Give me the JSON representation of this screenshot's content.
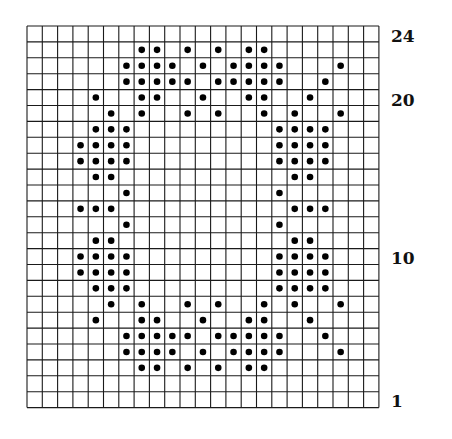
{
  "chart_data": {
    "type": "dot-grid-pattern",
    "title": "",
    "columns": 23,
    "rows": 24,
    "row_numbering": "bottom-to-top",
    "row_labels": [
      {
        "row": 24,
        "label": "24"
      },
      {
        "row": 20,
        "label": "20"
      },
      {
        "row": 10,
        "label": "10"
      },
      {
        "row": 1,
        "label": "1"
      }
    ],
    "dots_by_row": {
      "24": [],
      "23": [
        8,
        9,
        11,
        13,
        15,
        16
      ],
      "22": [
        7,
        8,
        9,
        10,
        12,
        14,
        15,
        16,
        17,
        21
      ],
      "21": [
        7,
        8,
        9,
        10,
        11,
        13,
        14,
        15,
        16,
        17,
        20
      ],
      "20": [
        5,
        8,
        9,
        12,
        15,
        16,
        19
      ],
      "19": [
        6,
        8,
        11,
        13,
        16,
        18,
        21
      ],
      "18": [
        5,
        6,
        7,
        17,
        18,
        19,
        20
      ],
      "17": [
        4,
        5,
        6,
        7,
        17,
        18,
        19,
        20
      ],
      "16": [
        4,
        5,
        6,
        7,
        17,
        18,
        19,
        20
      ],
      "15": [
        5,
        6,
        18,
        19
      ],
      "14": [
        7,
        17
      ],
      "13": [
        4,
        5,
        6,
        18,
        19,
        20
      ],
      "12": [
        7,
        17
      ],
      "11": [
        5,
        6,
        18,
        19
      ],
      "10": [
        4,
        5,
        6,
        7,
        17,
        18,
        19,
        20
      ],
      "9": [
        4,
        5,
        6,
        7,
        17,
        18,
        19,
        20
      ],
      "8": [
        5,
        6,
        7,
        17,
        18,
        19,
        20
      ],
      "7": [
        6,
        8,
        11,
        13,
        16,
        18,
        21
      ],
      "6": [
        5,
        8,
        9,
        12,
        15,
        16,
        19
      ],
      "5": [
        7,
        8,
        9,
        10,
        11,
        13,
        14,
        15,
        16,
        17,
        20
      ],
      "4": [
        7,
        8,
        9,
        10,
        12,
        14,
        15,
        16,
        17,
        21
      ],
      "3": [
        8,
        9,
        11,
        13,
        15,
        16
      ],
      "2": [],
      "1": []
    }
  },
  "labels": {
    "row24": "24",
    "row20": "20",
    "row10": "10",
    "row1": "1"
  },
  "colors": {
    "grid_line": "#1a1a1a",
    "dot": "#000000",
    "background": "#ffffff"
  }
}
